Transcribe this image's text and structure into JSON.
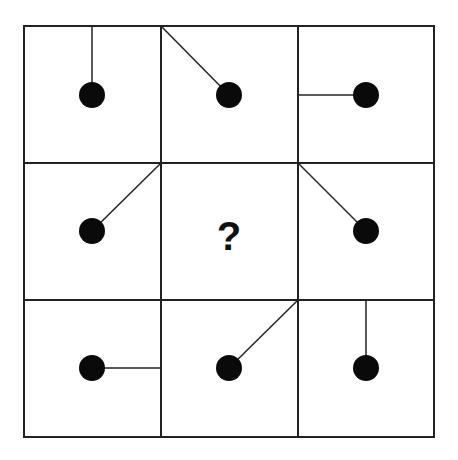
{
  "puzzle": {
    "title": "",
    "grid": {
      "rows": 3,
      "cols": 3,
      "left": 24,
      "top": 26,
      "right": 434,
      "bottom": 437,
      "col_lines": [
        161,
        298
      ],
      "row_lines": [
        163,
        300
      ]
    },
    "colors": {
      "line": "#222222",
      "dot": "#0a0a0a",
      "background": "#ffffff"
    },
    "dot_radius": 13,
    "cells": [
      {
        "row": 0,
        "col": 0,
        "dot": [
          92,
          95
        ],
        "line_from": [
          92,
          26
        ],
        "anchor": "top-middle"
      },
      {
        "row": 0,
        "col": 1,
        "dot": [
          229,
          95
        ],
        "line_from": [
          161,
          26
        ],
        "anchor": "top-left-corner"
      },
      {
        "row": 0,
        "col": 2,
        "dot": [
          366,
          95
        ],
        "line_from": [
          298,
          95
        ],
        "anchor": "left-middle"
      },
      {
        "row": 1,
        "col": 0,
        "dot": [
          92,
          231
        ],
        "line_from": [
          161,
          163
        ],
        "anchor": "top-right-corner"
      },
      {
        "row": 1,
        "col": 1,
        "unknown": true,
        "label": "?"
      },
      {
        "row": 1,
        "col": 2,
        "dot": [
          366,
          231
        ],
        "line_from": [
          298,
          163
        ],
        "anchor": "top-left-corner"
      },
      {
        "row": 2,
        "col": 0,
        "dot": [
          92,
          368
        ],
        "line_from": [
          161,
          368
        ],
        "anchor": "right-middle"
      },
      {
        "row": 2,
        "col": 1,
        "dot": [
          229,
          368
        ],
        "line_from": [
          298,
          300
        ],
        "anchor": "top-right-corner"
      },
      {
        "row": 2,
        "col": 2,
        "dot": [
          366,
          368
        ],
        "line_from": [
          366,
          300
        ],
        "anchor": "top-middle"
      }
    ],
    "question_mark": {
      "text": "?",
      "x": 229,
      "y": 250
    }
  }
}
